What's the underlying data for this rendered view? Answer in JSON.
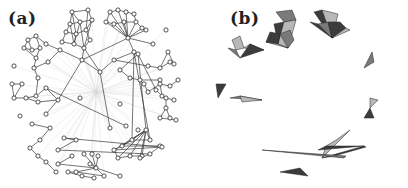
{
  "figure": {
    "panels": [
      {
        "id": "a",
        "label": "(a)",
        "description": "network with hollow circular nodes, gray edges, faint radial edges from central hub"
      },
      {
        "id": "b",
        "label": "(b)",
        "description": "same network with filled nodes and shaded simplices (gray triangles/tetrahedra)"
      }
    ],
    "colors": {
      "background": "#ffffff",
      "edge": "#3a3a3a",
      "faint_edge": "#d8d8d8",
      "node_stroke": "#2a2a2a",
      "node_fill_a": "#ffffff",
      "node_fill_b": "#555555",
      "simplex_dark": "#3c3c3c",
      "simplex_mid": "#7a7a7a",
      "simplex_light": "#b8b8b8"
    },
    "hub": [
      96,
      92
    ],
    "nodes": [
      [
        72,
        12
      ],
      [
        88,
        10
      ],
      [
        70,
        24
      ],
      [
        80,
        22
      ],
      [
        92,
        20
      ],
      [
        66,
        32
      ],
      [
        76,
        34
      ],
      [
        86,
        30
      ],
      [
        62,
        42
      ],
      [
        74,
        44
      ],
      [
        84,
        48
      ],
      [
        90,
        40
      ],
      [
        110,
        12
      ],
      [
        118,
        10
      ],
      [
        126,
        12
      ],
      [
        134,
        14
      ],
      [
        106,
        22
      ],
      [
        114,
        24
      ],
      [
        124,
        22
      ],
      [
        136,
        22
      ],
      [
        142,
        28
      ],
      [
        146,
        30
      ],
      [
        128,
        38
      ],
      [
        153,
        44
      ],
      [
        166,
        30
      ],
      [
        28,
        40
      ],
      [
        36,
        36
      ],
      [
        24,
        48
      ],
      [
        32,
        50
      ],
      [
        40,
        48
      ],
      [
        36,
        58
      ],
      [
        46,
        44
      ],
      [
        60,
        50
      ],
      [
        34,
        68
      ],
      [
        48,
        62
      ],
      [
        38,
        78
      ],
      [
        14,
        66
      ],
      [
        82,
        60
      ],
      [
        100,
        72
      ],
      [
        114,
        60
      ],
      [
        134,
        52
      ],
      [
        138,
        54
      ],
      [
        120,
        70
      ],
      [
        130,
        78
      ],
      [
        140,
        80
      ],
      [
        148,
        66
      ],
      [
        160,
        68
      ],
      [
        170,
        62
      ],
      [
        174,
        64
      ],
      [
        168,
        52
      ],
      [
        160,
        80
      ],
      [
        144,
        84
      ],
      [
        148,
        92
      ],
      [
        160,
        84
      ],
      [
        170,
        86
      ],
      [
        178,
        80
      ],
      [
        162,
        96
      ],
      [
        166,
        98
      ],
      [
        174,
        100
      ],
      [
        166,
        108
      ],
      [
        170,
        118
      ],
      [
        160,
        118
      ],
      [
        176,
        120
      ],
      [
        156,
        90
      ],
      [
        12,
        84
      ],
      [
        22,
        84
      ],
      [
        14,
        98
      ],
      [
        26,
        98
      ],
      [
        36,
        96
      ],
      [
        46,
        88
      ],
      [
        38,
        102
      ],
      [
        58,
        100
      ],
      [
        46,
        114
      ],
      [
        20,
        116
      ],
      [
        32,
        124
      ],
      [
        50,
        128
      ],
      [
        40,
        140
      ],
      [
        30,
        148
      ],
      [
        38,
        156
      ],
      [
        46,
        162
      ],
      [
        56,
        172
      ],
      [
        80,
        98
      ],
      [
        120,
        104
      ],
      [
        126,
        126
      ],
      [
        110,
        128
      ],
      [
        138,
        130
      ],
      [
        146,
        130
      ],
      [
        150,
        140
      ],
      [
        132,
        140
      ],
      [
        122,
        146
      ],
      [
        114,
        150
      ],
      [
        118,
        158
      ],
      [
        130,
        156
      ],
      [
        142,
        156
      ],
      [
        140,
        158
      ],
      [
        150,
        154
      ],
      [
        160,
        146
      ],
      [
        162,
        147
      ],
      [
        64,
        138
      ],
      [
        76,
        140
      ],
      [
        58,
        150
      ],
      [
        72,
        156
      ],
      [
        58,
        164
      ],
      [
        84,
        154
      ],
      [
        92,
        154
      ],
      [
        98,
        156
      ],
      [
        90,
        164
      ],
      [
        96,
        168
      ],
      [
        104,
        176
      ],
      [
        76,
        172
      ],
      [
        68,
        172
      ],
      [
        82,
        176
      ],
      [
        94,
        178
      ],
      [
        120,
        176
      ]
    ],
    "edges": [
      [
        0,
        1
      ],
      [
        0,
        2
      ],
      [
        0,
        3
      ],
      [
        1,
        4
      ],
      [
        2,
        3
      ],
      [
        3,
        4
      ],
      [
        2,
        5
      ],
      [
        5,
        6
      ],
      [
        6,
        7
      ],
      [
        7,
        4
      ],
      [
        5,
        8
      ],
      [
        6,
        9
      ],
      [
        8,
        9
      ],
      [
        9,
        10
      ],
      [
        10,
        11
      ],
      [
        11,
        7
      ],
      [
        3,
        9
      ],
      [
        4,
        10
      ],
      [
        0,
        6
      ],
      [
        1,
        7
      ],
      [
        2,
        9
      ],
      [
        3,
        10
      ],
      [
        12,
        13
      ],
      [
        13,
        14
      ],
      [
        14,
        15
      ],
      [
        12,
        16
      ],
      [
        16,
        17
      ],
      [
        17,
        18
      ],
      [
        18,
        19
      ],
      [
        19,
        20
      ],
      [
        20,
        21
      ],
      [
        15,
        19
      ],
      [
        16,
        22
      ],
      [
        17,
        22
      ],
      [
        18,
        22
      ],
      [
        19,
        22
      ],
      [
        20,
        22
      ],
      [
        21,
        22
      ],
      [
        13,
        22
      ],
      [
        14,
        22
      ],
      [
        12,
        22
      ],
      [
        22,
        23
      ],
      [
        22,
        40
      ],
      [
        22,
        37
      ],
      [
        25,
        26
      ],
      [
        25,
        27
      ],
      [
        26,
        29
      ],
      [
        27,
        28
      ],
      [
        28,
        29
      ],
      [
        29,
        30
      ],
      [
        26,
        31
      ],
      [
        25,
        28
      ],
      [
        27,
        30
      ],
      [
        31,
        32
      ],
      [
        32,
        37
      ],
      [
        30,
        33
      ],
      [
        33,
        34
      ],
      [
        33,
        35
      ],
      [
        34,
        32
      ],
      [
        10,
        37
      ],
      [
        10,
        38
      ],
      [
        37,
        38
      ],
      [
        38,
        39
      ],
      [
        39,
        40
      ],
      [
        40,
        41
      ],
      [
        41,
        42
      ],
      [
        42,
        43
      ],
      [
        43,
        44
      ],
      [
        39,
        45
      ],
      [
        45,
        46
      ],
      [
        46,
        47
      ],
      [
        47,
        48
      ],
      [
        48,
        49
      ],
      [
        46,
        49
      ],
      [
        44,
        50
      ],
      [
        44,
        51
      ],
      [
        51,
        52
      ],
      [
        52,
        53
      ],
      [
        53,
        54
      ],
      [
        54,
        55
      ],
      [
        53,
        56
      ],
      [
        56,
        57
      ],
      [
        57,
        58
      ],
      [
        57,
        59
      ],
      [
        59,
        60
      ],
      [
        59,
        61
      ],
      [
        61,
        62
      ],
      [
        41,
        63
      ],
      [
        63,
        56
      ],
      [
        38,
        120
      ],
      [
        40,
        88
      ],
      [
        40,
        87
      ],
      [
        41,
        86
      ],
      [
        64,
        65
      ],
      [
        65,
        66
      ],
      [
        64,
        66
      ],
      [
        66,
        67
      ],
      [
        67,
        68
      ],
      [
        68,
        69
      ],
      [
        67,
        70
      ],
      [
        70,
        71
      ],
      [
        71,
        72
      ],
      [
        69,
        71
      ],
      [
        35,
        68
      ],
      [
        69,
        83
      ],
      [
        74,
        75
      ],
      [
        75,
        76
      ],
      [
        76,
        77
      ],
      [
        77,
        78
      ],
      [
        78,
        79
      ],
      [
        79,
        80
      ],
      [
        86,
        87
      ],
      [
        86,
        88
      ],
      [
        86,
        89
      ],
      [
        86,
        90
      ],
      [
        86,
        91
      ],
      [
        86,
        92
      ],
      [
        86,
        93
      ],
      [
        86,
        94
      ],
      [
        87,
        88
      ],
      [
        88,
        89
      ],
      [
        89,
        90
      ],
      [
        90,
        91
      ],
      [
        91,
        92
      ],
      [
        92,
        93
      ],
      [
        93,
        94
      ],
      [
        94,
        95
      ],
      [
        95,
        96
      ],
      [
        96,
        97
      ],
      [
        97,
        98
      ],
      [
        98,
        99
      ],
      [
        99,
        100
      ],
      [
        95,
        100
      ],
      [
        96,
        89
      ],
      [
        90,
        97
      ],
      [
        101,
        102
      ],
      [
        102,
        107
      ],
      [
        103,
        107
      ],
      [
        104,
        107
      ],
      [
        105,
        107
      ],
      [
        106,
        107
      ],
      [
        107,
        108
      ],
      [
        107,
        109
      ],
      [
        107,
        113
      ],
      [
        108,
        109
      ],
      [
        109,
        110
      ],
      [
        110,
        111
      ],
      [
        111,
        112
      ],
      [
        109,
        114
      ],
      [
        114,
        115
      ],
      [
        113,
        115
      ],
      [
        108,
        116
      ],
      [
        116,
        117
      ],
      [
        117,
        88
      ],
      [
        108,
        118
      ],
      [
        84,
        38
      ],
      [
        71,
        37
      ]
    ],
    "simplices": [
      {
        "pts": [
          0,
          1,
          4,
          3
        ],
        "shade": "mid"
      },
      {
        "pts": [
          2,
          3,
          9
        ],
        "shade": "dark"
      },
      {
        "pts": [
          3,
          4,
          10,
          9
        ],
        "shade": "light"
      },
      {
        "pts": [
          5,
          6,
          9,
          8
        ],
        "shade": "dark"
      },
      {
        "pts": [
          6,
          7,
          11,
          10
        ],
        "shade": "mid"
      },
      {
        "pts": [
          8,
          9,
          10
        ],
        "shade": "light"
      },
      {
        "pts": [
          12,
          13,
          22
        ],
        "shade": "dark"
      },
      {
        "pts": [
          13,
          14,
          15,
          22
        ],
        "shade": "light"
      },
      {
        "pts": [
          16,
          17,
          22
        ],
        "shade": "dark"
      },
      {
        "pts": [
          17,
          18,
          22
        ],
        "shade": "mid"
      },
      {
        "pts": [
          18,
          19,
          20,
          22
        ],
        "shade": "dark"
      },
      {
        "pts": [
          20,
          21,
          22
        ],
        "shade": "light"
      },
      {
        "pts": [
          25,
          26,
          29,
          28
        ],
        "shade": "light"
      },
      {
        "pts": [
          27,
          28,
          30
        ],
        "shade": "mid"
      },
      {
        "pts": [
          29,
          31,
          32
        ],
        "shade": "light"
      },
      {
        "pts": [
          30,
          31,
          32
        ],
        "shade": "dark"
      },
      {
        "pts": [
          46,
          47,
          49
        ],
        "shade": "mid"
      },
      {
        "pts": [
          57,
          58,
          59
        ],
        "shade": "light"
      },
      {
        "pts": [
          59,
          60,
          61
        ],
        "shade": "dark"
      },
      {
        "pts": [
          64,
          65,
          66
        ],
        "shade": "dark"
      },
      {
        "pts": [
          67,
          68,
          71
        ],
        "shade": "mid"
      },
      {
        "pts": [
          68,
          70,
          71
        ],
        "shade": "light"
      },
      {
        "pts": [
          86,
          88,
          89,
          91
        ],
        "shade": "light"
      },
      {
        "pts": [
          89,
          90,
          96
        ],
        "shade": "dark"
      },
      {
        "pts": [
          91,
          92,
          97,
          96
        ],
        "shade": "dark"
      },
      {
        "pts": [
          93,
          94,
          100
        ],
        "shade": "mid"
      },
      {
        "pts": [
          107,
          108,
          109
        ],
        "shade": "dark"
      },
      {
        "pts": [
          107,
          113,
          115
        ],
        "shade": "light"
      },
      {
        "pts": [
          108,
          109,
          110
        ],
        "shade": "mid"
      },
      {
        "pts": [
          109,
          114,
          115
        ],
        "shade": "light"
      }
    ]
  }
}
